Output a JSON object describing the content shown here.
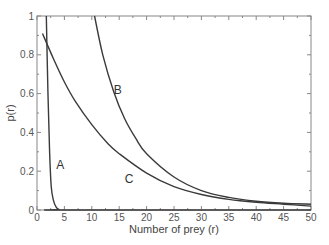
{
  "chart_data": {
    "type": "line",
    "title": "",
    "xlabel": "Number of prey (r)",
    "ylabel": "p(r)",
    "xlim": [
      0,
      50
    ],
    "ylim": [
      0,
      1
    ],
    "xticks": [
      0,
      5,
      10,
      15,
      20,
      25,
      30,
      35,
      40,
      45,
      50
    ],
    "yticks": [
      0,
      0.2,
      0.4,
      0.6,
      0.8,
      1
    ],
    "ytick_labels": [
      "0",
      "0.2",
      "0.4",
      "0.6",
      "0.8",
      "1"
    ],
    "grid": false,
    "legend": "none (curves labeled inline)",
    "series": [
      {
        "name": "A",
        "x": [
          1.7,
          2.0,
          2.3,
          2.6,
          3.0,
          3.5,
          4.0,
          5.0,
          50
        ],
        "values": [
          1.0,
          0.6,
          0.3,
          0.12,
          0.05,
          0.015,
          0.003,
          0.0,
          0.0
        ],
        "label_pos": [
          3.5,
          0.21
        ]
      },
      {
        "name": "B",
        "x": [
          10.5,
          12,
          14,
          16,
          18,
          20,
          25,
          30,
          35,
          40,
          45,
          50
        ],
        "values": [
          1.0,
          0.8,
          0.61,
          0.47,
          0.37,
          0.29,
          0.17,
          0.1,
          0.065,
          0.045,
          0.035,
          0.03
        ],
        "label_pos": [
          14,
          0.6
        ]
      },
      {
        "name": "C",
        "x": [
          1,
          3,
          5,
          7,
          10,
          13,
          15,
          20,
          25,
          30,
          35,
          40,
          45,
          50
        ],
        "values": [
          0.91,
          0.78,
          0.66,
          0.56,
          0.44,
          0.34,
          0.29,
          0.19,
          0.12,
          0.08,
          0.055,
          0.04,
          0.03,
          0.02
        ],
        "label_pos": [
          16,
          0.14
        ]
      }
    ]
  },
  "axes": {
    "xlabel": "Number of prey (r)",
    "ylabel": "p(r)"
  },
  "colors": {
    "curve": "#3a3a3a",
    "axis": "#888888",
    "text": "#555555"
  }
}
